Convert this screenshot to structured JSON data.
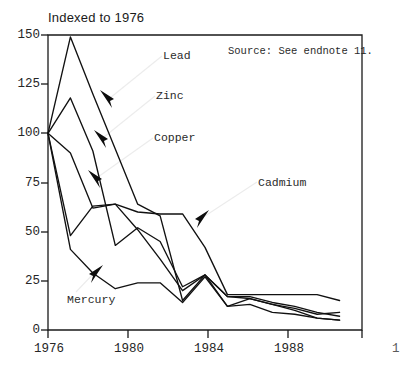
{
  "title": "Indexed to 1976",
  "source_note": "Source: See endnote 11.",
  "axis": {
    "y_ticks": [
      "0",
      "25",
      "50",
      "75",
      "100",
      "125",
      "150"
    ],
    "x_ticks": [
      "1976",
      "1980",
      "1984",
      "1988"
    ],
    "x_tick_partial": "1"
  },
  "series_labels": {
    "lead": "Lead",
    "zinc": "Zinc",
    "copper": "Copper",
    "cadmium": "Cadmium",
    "mercury": "Mercury"
  },
  "colors": {
    "line": "#111111",
    "frame": "#1a1a1a",
    "text": "#262626",
    "leader": "#e8e8e8",
    "background": "#ffffff"
  },
  "chart_data": {
    "type": "line",
    "title": "Indexed to 1976",
    "subtitle": "",
    "xlabel": "",
    "ylabel": "",
    "xlim": [
      1976,
      1990
    ],
    "ylim": [
      0,
      150
    ],
    "y_ticks": [
      0,
      25,
      50,
      75,
      100,
      125,
      150
    ],
    "x_ticks": [
      1976,
      1980,
      1984,
      1988
    ],
    "grid": false,
    "legend": "inline-annotations",
    "annotations": [
      {
        "text": "Lead",
        "x": 1982.2,
        "y": 137
      },
      {
        "text": "Zinc",
        "x": 1981.9,
        "y": 113
      },
      {
        "text": "Copper",
        "x": 1982.3,
        "y": 94
      },
      {
        "text": "Cadmium",
        "x": 1987.0,
        "y": 78
      },
      {
        "text": "Mercury",
        "x": 1978.4,
        "y": 14
      },
      {
        "text": "Source: See endnote 11.",
        "x": 1987.8,
        "y": 143
      }
    ],
    "x": [
      1976,
      1977,
      1978,
      1979,
      1980,
      1981,
      1982,
      1983,
      1984,
      1985,
      1986,
      1987,
      1988,
      1989
    ],
    "series": [
      {
        "name": "Lead",
        "values": [
          100,
          149,
          120,
          92,
          64,
          58,
          15,
          28,
          12,
          13,
          9,
          8,
          6,
          5
        ]
      },
      {
        "name": "Zinc",
        "values": [
          100,
          118,
          91,
          43,
          52,
          45,
          22,
          28,
          17,
          16,
          13,
          11,
          8,
          9
        ]
      },
      {
        "name": "Copper",
        "values": [
          100,
          90,
          62,
          64,
          51,
          36,
          20,
          28,
          17,
          17,
          14,
          12,
          9,
          7
        ]
      },
      {
        "name": "Cadmium",
        "values": [
          100,
          48,
          63,
          64,
          60,
          59,
          59,
          42,
          18,
          18,
          18,
          18,
          18,
          15
        ]
      },
      {
        "name": "Mercury",
        "values": [
          100,
          41,
          29,
          21,
          24,
          24,
          14,
          27,
          12,
          16,
          13,
          10,
          6,
          5
        ]
      }
    ]
  }
}
